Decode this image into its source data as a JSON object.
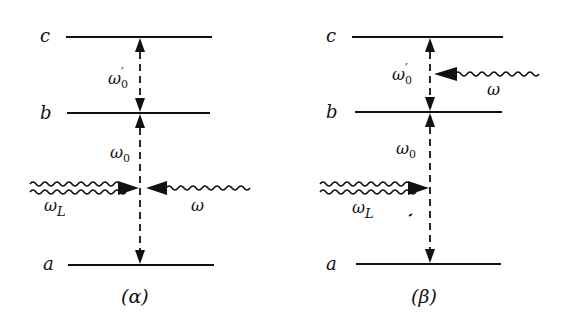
{
  "panels": [
    {
      "id": "alpha",
      "caption": "(α)",
      "levels": [
        {
          "name": "c",
          "label": "c"
        },
        {
          "name": "b",
          "label": "b"
        },
        {
          "name": "a",
          "label": "a"
        }
      ],
      "transitions": [
        {
          "between": "b-c",
          "label": "ω",
          "sub": "0",
          "prime": "′"
        },
        {
          "between": "a-b",
          "label": "ω",
          "sub": "0"
        }
      ],
      "photons": [
        {
          "name": "laser",
          "label": "ω",
          "sub": "L",
          "direction": "right"
        },
        {
          "name": "field",
          "label": "ω",
          "direction": "left"
        }
      ]
    },
    {
      "id": "beta",
      "caption": "(β)",
      "levels": [
        {
          "name": "c",
          "label": "c"
        },
        {
          "name": "b",
          "label": "b"
        },
        {
          "name": "a",
          "label": "a"
        }
      ],
      "transitions": [
        {
          "between": "b-c",
          "label": "ω",
          "sub": "0",
          "prime": "′"
        },
        {
          "between": "a-b",
          "label": "ω",
          "sub": "0"
        }
      ],
      "photons": [
        {
          "name": "laser",
          "label": "ω",
          "sub": "L",
          "direction": "right"
        },
        {
          "name": "field",
          "label": "ω",
          "direction": "left"
        }
      ]
    }
  ]
}
